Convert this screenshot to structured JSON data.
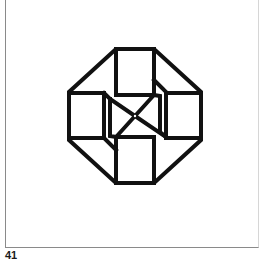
{
  "figure": {
    "number_label": "41",
    "stroke_color": "#111111",
    "background_color": "#ffffff",
    "frame_color": "#8a8a8a"
  }
}
